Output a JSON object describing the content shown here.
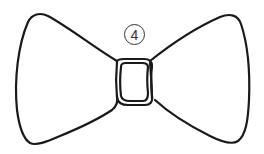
{
  "illustration": {
    "subject": "bow-tie",
    "label_number": "4",
    "stroke_color": "#1a1a1a",
    "label_color": "#333333",
    "background": "#ffffff"
  }
}
